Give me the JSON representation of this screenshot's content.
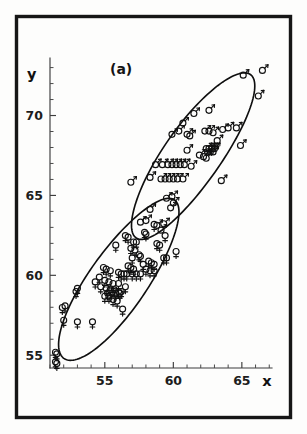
{
  "figure": {
    "panel_label": "(a)",
    "frame": {
      "color": "#161616"
    },
    "axis_color": "#3c3c3c",
    "ellipse_color": "#0f0f0f",
    "symbol_color": "#111111"
  },
  "chart_data": {
    "type": "scatter",
    "title": "(a)",
    "xlabel": "x",
    "ylabel": "y",
    "xlim": [
      51,
      67.2
    ],
    "ylim": [
      54.2,
      73.6
    ],
    "grid": false,
    "legend": "none",
    "x_major_ticks": [
      55,
      60,
      65
    ],
    "x_major_tick_labels": [
      "55",
      "60",
      "65"
    ],
    "x_minor_tick_interval": 1,
    "y_major_ticks": [
      55,
      60,
      65,
      70
    ],
    "y_major_tick_labels": [
      "55",
      "60",
      "65",
      "70"
    ],
    "y_minor_tick_interval": 1,
    "series": [
      {
        "name": "male",
        "marker": "mars-symbol",
        "marker_glyph": "♂",
        "count": 56,
        "points": [
          [
            60.7,
            69.6
          ],
          [
            61.5,
            70.2
          ],
          [
            62.6,
            70.4
          ],
          [
            66.5,
            72.9
          ],
          [
            66.2,
            71.3
          ],
          [
            65.1,
            72.6
          ],
          [
            63.6,
            69.2
          ],
          [
            64.0,
            69.3
          ],
          [
            64.6,
            69.3
          ],
          [
            62.3,
            69.1
          ],
          [
            62.6,
            69.1
          ],
          [
            62.9,
            69.0
          ],
          [
            60.4,
            69.1
          ],
          [
            61.0,
            68.9
          ],
          [
            61.2,
            68.8
          ],
          [
            59.9,
            68.9
          ],
          [
            63.2,
            68.5
          ],
          [
            64.9,
            68.2
          ],
          [
            62.4,
            68.0
          ],
          [
            62.6,
            68.0
          ],
          [
            62.8,
            68.0
          ],
          [
            63.0,
            68.0
          ],
          [
            62.5,
            67.8
          ],
          [
            62.7,
            67.8
          ],
          [
            62.9,
            67.8
          ],
          [
            61.0,
            67.9
          ],
          [
            61.9,
            67.6
          ],
          [
            62.2,
            67.5
          ],
          [
            62.4,
            67.4
          ],
          [
            58.7,
            67.0
          ],
          [
            59.2,
            67.0
          ],
          [
            59.6,
            67.0
          ],
          [
            59.9,
            67.0
          ],
          [
            60.2,
            67.0
          ],
          [
            60.5,
            67.0
          ],
          [
            60.8,
            67.0
          ],
          [
            61.3,
            66.9
          ],
          [
            58.3,
            66.2
          ],
          [
            59.1,
            66.1
          ],
          [
            59.4,
            66.1
          ],
          [
            59.7,
            66.1
          ],
          [
            60.0,
            66.1
          ],
          [
            60.3,
            66.1
          ],
          [
            60.7,
            66.1
          ],
          [
            56.9,
            65.9
          ],
          [
            63.5,
            66.0
          ],
          [
            59.9,
            65.0
          ],
          [
            59.5,
            64.9
          ],
          [
            60.0,
            64.6
          ],
          [
            59.8,
            64.3
          ],
          [
            58.3,
            64.2
          ],
          [
            57.6,
            63.4
          ],
          [
            58.0,
            63.5
          ],
          [
            59.3,
            63.3
          ],
          [
            58.8,
            63.2
          ],
          [
            59.1,
            62.9
          ]
        ]
      },
      {
        "name": "female",
        "marker": "venus-symbol",
        "marker_glyph": "♀",
        "count": 72,
        "points": [
          [
            58.6,
            63.1
          ],
          [
            57.9,
            62.6
          ],
          [
            58.0,
            62.5
          ],
          [
            59.4,
            62.4
          ],
          [
            56.5,
            62.4
          ],
          [
            56.7,
            62.3
          ],
          [
            57.1,
            62.0
          ],
          [
            57.3,
            62.0
          ],
          [
            58.8,
            61.9
          ],
          [
            59.0,
            61.8
          ],
          [
            55.8,
            61.8
          ],
          [
            56.9,
            61.6
          ],
          [
            57.2,
            61.5
          ],
          [
            60.2,
            61.4
          ],
          [
            57.5,
            61.2
          ],
          [
            57.6,
            61.1
          ],
          [
            57.0,
            61.0
          ],
          [
            59.3,
            61.0
          ],
          [
            59.5,
            61.0
          ],
          [
            58.2,
            60.8
          ],
          [
            58.4,
            60.7
          ],
          [
            58.6,
            60.6
          ],
          [
            57.8,
            60.6
          ],
          [
            56.7,
            60.5
          ],
          [
            56.9,
            60.4
          ],
          [
            57.1,
            60.3
          ],
          [
            58.0,
            60.3
          ],
          [
            58.3,
            60.2
          ],
          [
            58.6,
            60.2
          ],
          [
            54.9,
            60.4
          ],
          [
            55.1,
            60.3
          ],
          [
            55.4,
            60.2
          ],
          [
            56.0,
            60.1
          ],
          [
            56.2,
            60.0
          ],
          [
            56.4,
            60.0
          ],
          [
            56.6,
            60.0
          ],
          [
            57.0,
            60.0
          ],
          [
            57.3,
            60.0
          ],
          [
            57.6,
            60.0
          ],
          [
            54.6,
            59.8
          ],
          [
            55.0,
            59.6
          ],
          [
            55.3,
            59.5
          ],
          [
            55.6,
            59.4
          ],
          [
            56.0,
            59.4
          ],
          [
            54.3,
            59.5
          ],
          [
            54.7,
            59.2
          ],
          [
            55.1,
            59.1
          ],
          [
            55.4,
            59.0
          ],
          [
            55.7,
            59.0
          ],
          [
            56.0,
            58.9
          ],
          [
            56.2,
            58.9
          ],
          [
            55.2,
            58.8
          ],
          [
            55.5,
            58.8
          ],
          [
            55.8,
            58.8
          ],
          [
            56.1,
            58.8
          ],
          [
            53.0,
            59.1
          ],
          [
            52.9,
            58.9
          ],
          [
            55.6,
            58.4
          ],
          [
            55.9,
            58.3
          ],
          [
            52.1,
            58.0
          ],
          [
            51.9,
            57.9
          ],
          [
            56.3,
            57.8
          ],
          [
            52.0,
            57.1
          ],
          [
            53.0,
            57.0
          ],
          [
            54.1,
            57.0
          ],
          [
            51.4,
            55.1
          ],
          [
            51.5,
            55.0
          ],
          [
            51.4,
            54.5
          ],
          [
            51.5,
            54.4
          ],
          [
            55.3,
            58.6
          ],
          [
            55.0,
            58.6
          ],
          [
            56.5,
            59.2
          ]
        ]
      }
    ],
    "annotations": [
      {
        "type": "ellipse",
        "label": "male-confidence-ellipse",
        "cx": 61.4,
        "cy": 67.5,
        "rx": 6.6,
        "ry": 1.95,
        "angle_deg": -50
      },
      {
        "type": "ellipse",
        "label": "female-confidence-ellipse",
        "cx": 56.0,
        "cy": 59.7,
        "rx": 6.4,
        "ry": 2.0,
        "angle_deg": -50
      }
    ]
  }
}
